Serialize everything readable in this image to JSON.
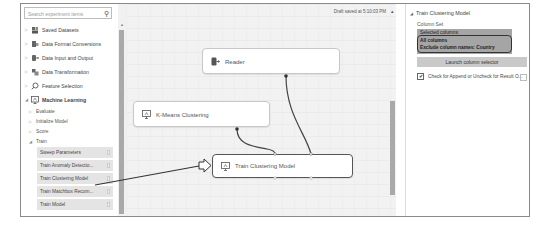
{
  "palette": {
    "search_placeholder": "Search experiment items",
    "search_icon": "magnifier-icon",
    "categories": [
      {
        "label": "Saved Datasets",
        "icon": "dataset-icon",
        "expanded": false
      },
      {
        "label": "Data Format Conversions",
        "icon": "conversion-icon",
        "expanded": false
      },
      {
        "label": "Data Input and Output",
        "icon": "input-output-icon",
        "expanded": false
      },
      {
        "label": "Data Transformation",
        "icon": "transformation-icon",
        "expanded": false
      },
      {
        "label": "Feature Selection",
        "icon": "feature-selection-icon",
        "expanded": false
      },
      {
        "label": "Machine Learning",
        "icon": "machine-learning-icon",
        "expanded": true
      }
    ],
    "ml_subcategories": [
      {
        "label": "Evaluate",
        "expanded": false
      },
      {
        "label": "Initialize Model",
        "expanded": false
      },
      {
        "label": "Score",
        "expanded": false
      },
      {
        "label": "Train",
        "expanded": true
      }
    ],
    "train_modules": [
      "Sweep Parameters",
      "Train Anomaly Detectio...",
      "Train Clustering Model",
      "Train Matchbox Recom...",
      "Train Model"
    ]
  },
  "canvas": {
    "status": "Draft saved at 5:10:03 PM",
    "nodes": {
      "reader": "Reader",
      "kmeans": "K-Means Clustering",
      "train_clustering": "Train Clustering Model"
    }
  },
  "properties": {
    "title": "Train Clustering Model",
    "column_set_label": "Column Set",
    "column_set_lines": [
      "Selected columns:",
      "All columns",
      "Exclude column names: Country"
    ],
    "launch_button": "Launch column selector",
    "checkbox_label": "Check for Append or Uncheck for Result O...",
    "checkbox_checked": true
  },
  "colors": {
    "frame_border": "#8a8a8a",
    "canvas_bg": "#f2f2f2",
    "module_bg": "#e4e4e4",
    "scroll_thumb": "#a9a9a9",
    "colbox_bg": "#a5a5a5",
    "wire": "#444444"
  }
}
